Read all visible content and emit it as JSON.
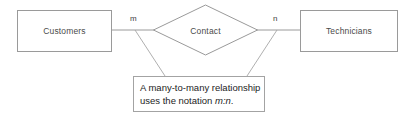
{
  "diagram": {
    "type": "entity-relationship-diagram",
    "background_color": "#ffffff",
    "stroke_color": "#9a9a9a",
    "text_color": "#4a4a4a",
    "entities": [
      {
        "id": "customers",
        "label": "Customers",
        "shape": "rectangle"
      },
      {
        "id": "technicians",
        "label": "Technicians",
        "shape": "rectangle"
      }
    ],
    "relationship": {
      "id": "contact",
      "label": "Contact",
      "shape": "diamond"
    },
    "cardinalities": [
      {
        "id": "left",
        "label": "m"
      },
      {
        "id": "right",
        "label": "n"
      }
    ],
    "callout": {
      "line1": "A many-to-many relationship",
      "line2_prefix": "uses the notation ",
      "line2_italic": "m:n",
      "line2_suffix": "."
    }
  }
}
